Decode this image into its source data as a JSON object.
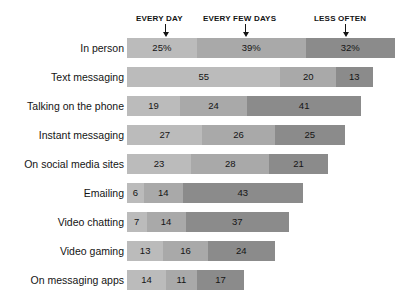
{
  "chart_data": {
    "type": "bar",
    "orientation": "horizontal",
    "stacked": true,
    "title": "",
    "subtitle": "",
    "xlabel": "",
    "ylabel": "",
    "grid": false,
    "legend_position": "top-inline-annotations",
    "xlim": [
      0,
      96
    ],
    "unit_px": 2.79,
    "categories": [
      "In person",
      "Text messaging",
      "Talking on the phone",
      "Instant messaging",
      "On social media sites",
      "Emailing",
      "Video chatting",
      "Video gaming",
      "On messaging apps"
    ],
    "series": [
      {
        "name": "EVERY DAY",
        "color": "#bbbbbb",
        "values": [
          25,
          55,
          19,
          27,
          23,
          6,
          7,
          13,
          14
        ]
      },
      {
        "name": "EVERY FEW DAYS",
        "color": "#a9a9a9",
        "values": [
          39,
          20,
          24,
          26,
          28,
          14,
          14,
          16,
          11
        ]
      },
      {
        "name": "LESS OFTEN",
        "color": "#8b8b8b",
        "values": [
          32,
          13,
          41,
          25,
          21,
          43,
          37,
          24,
          17
        ]
      }
    ],
    "data_labels": [
      [
        "25%",
        "39%",
        "32%"
      ],
      [
        "55",
        "20",
        "13"
      ],
      [
        "19",
        "24",
        "41"
      ],
      [
        "27",
        "26",
        "25"
      ],
      [
        "23",
        "28",
        "21"
      ],
      [
        "6",
        "14",
        "43"
      ],
      [
        "7",
        "14",
        "37"
      ],
      [
        "13",
        "16",
        "24"
      ],
      [
        "14",
        "11",
        "17"
      ]
    ],
    "annotations": [
      {
        "label": "EVERY DAY",
        "arrow_x_px": 165,
        "label_left_px": 136
      },
      {
        "label": "EVERY FEW DAYS",
        "arrow_x_px": 245,
        "label_left_px": 203
      },
      {
        "label": "LESS OFTEN",
        "arrow_x_px": 345,
        "label_left_px": 314
      }
    ]
  }
}
